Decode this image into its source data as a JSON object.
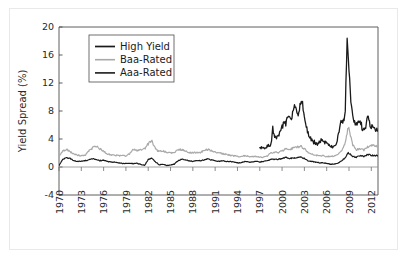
{
  "figure": {
    "background_color": "#ffffff",
    "frame_color": "#e9e9e9"
  },
  "chart_data": {
    "type": "line",
    "title": "",
    "xlabel": "",
    "ylabel": "Yield Spread (%)",
    "xlim": [
      1970,
      2012.9
    ],
    "ylim": [
      -4,
      20
    ],
    "grid": false,
    "legend_position": "upper-left",
    "x_tick_labels": [
      "1970",
      "1973",
      "1976",
      "1979",
      "1982",
      "1985",
      "1988",
      "1991",
      "1994",
      "1997",
      "2000",
      "2003",
      "2006",
      "2009",
      "2012"
    ],
    "x_ticks": [
      1970,
      1973,
      1976,
      1979,
      1982,
      1985,
      1988,
      1991,
      1994,
      1997,
      2000,
      2003,
      2006,
      2009,
      2012
    ],
    "y_tick_labels": [
      "20",
      "16",
      "12",
      "8",
      "4",
      "0",
      "-4"
    ],
    "y_ticks": [
      20,
      16,
      12,
      8,
      4,
      0,
      -4
    ],
    "zero_line": 0,
    "series": [
      {
        "name": "High Yield",
        "color": "#1a1a1a",
        "width": 1.3,
        "x_start": 1997.0,
        "x": [
          1997.0,
          1997.25,
          1997.5,
          1997.75,
          1998.0,
          1998.25,
          1998.5,
          1998.75,
          1999.0,
          1999.25,
          1999.5,
          1999.75,
          2000.0,
          2000.25,
          2000.5,
          2000.75,
          2001.0,
          2001.25,
          2001.5,
          2001.75,
          2002.0,
          2002.25,
          2002.5,
          2002.75,
          2003.0,
          2003.25,
          2003.5,
          2003.75,
          2004.0,
          2004.25,
          2004.5,
          2004.75,
          2005.0,
          2005.25,
          2005.5,
          2005.75,
          2006.0,
          2006.25,
          2006.5,
          2006.75,
          2007.0,
          2007.25,
          2007.5,
          2007.75,
          2008.0,
          2008.25,
          2008.5,
          2008.75,
          2009.0,
          2009.25,
          2009.5,
          2009.75,
          2010.0,
          2010.25,
          2010.5,
          2010.75,
          2011.0,
          2011.25,
          2011.5,
          2011.75,
          2012.0,
          2012.5,
          2012.9
        ],
        "values": [
          3.0,
          2.7,
          2.6,
          2.8,
          2.9,
          3.1,
          3.3,
          5.4,
          4.6,
          4.3,
          4.4,
          4.8,
          5.6,
          6.4,
          6.2,
          7.1,
          7.5,
          7.0,
          8.2,
          8.9,
          8.0,
          7.6,
          9.3,
          9.0,
          7.2,
          5.6,
          4.8,
          4.3,
          3.8,
          3.6,
          3.5,
          3.3,
          3.6,
          3.8,
          3.7,
          3.6,
          3.4,
          3.2,
          3.0,
          2.9,
          2.8,
          3.1,
          4.2,
          5.2,
          6.8,
          6.4,
          8.4,
          18.4,
          14.0,
          9.0,
          7.2,
          6.4,
          5.9,
          6.4,
          6.8,
          5.6,
          5.2,
          5.6,
          7.4,
          6.4,
          5.8,
          5.4,
          5.1
        ]
      },
      {
        "name": "Baa-Rated",
        "color": "#a9a9a9",
        "width": 1.2,
        "x_start": 1970.0,
        "x": [
          1970.0,
          1970.5,
          1971.0,
          1971.5,
          1972.0,
          1972.5,
          1973.0,
          1973.5,
          1974.0,
          1974.5,
          1975.0,
          1975.5,
          1976.0,
          1976.5,
          1977.0,
          1977.5,
          1978.0,
          1978.5,
          1979.0,
          1979.5,
          1980.0,
          1980.5,
          1981.0,
          1981.5,
          1982.0,
          1982.5,
          1983.0,
          1983.5,
          1984.0,
          1984.5,
          1985.0,
          1985.5,
          1986.0,
          1986.5,
          1987.0,
          1987.5,
          1988.0,
          1988.5,
          1989.0,
          1989.5,
          1990.0,
          1990.5,
          1991.0,
          1991.5,
          1992.0,
          1992.5,
          1993.0,
          1993.5,
          1994.0,
          1994.5,
          1995.0,
          1995.5,
          1996.0,
          1996.5,
          1997.0,
          1997.5,
          1998.0,
          1998.5,
          1999.0,
          1999.5,
          2000.0,
          2000.5,
          2001.0,
          2001.5,
          2002.0,
          2002.5,
          2003.0,
          2003.5,
          2004.0,
          2004.5,
          2005.0,
          2005.5,
          2006.0,
          2006.5,
          2007.0,
          2007.5,
          2008.0,
          2008.5,
          2008.9,
          2009.2,
          2009.5,
          2010.0,
          2010.5,
          2011.0,
          2011.5,
          2012.0,
          2012.5,
          2012.9
        ],
        "values": [
          1.5,
          2.3,
          2.5,
          2.2,
          1.9,
          1.7,
          1.6,
          1.7,
          2.3,
          2.7,
          3.0,
          2.6,
          2.2,
          1.9,
          1.7,
          1.7,
          1.6,
          1.6,
          1.6,
          1.9,
          2.6,
          2.4,
          2.4,
          2.6,
          3.3,
          3.7,
          2.5,
          2.2,
          2.3,
          2.1,
          2.0,
          2.1,
          2.4,
          2.5,
          2.3,
          2.1,
          2.0,
          2.1,
          2.1,
          2.3,
          2.5,
          2.3,
          2.1,
          2.0,
          1.9,
          1.8,
          1.7,
          1.6,
          1.5,
          1.5,
          1.6,
          1.5,
          1.5,
          1.5,
          1.4,
          1.4,
          1.6,
          2.0,
          2.1,
          2.1,
          2.3,
          2.6,
          2.5,
          2.7,
          2.8,
          3.0,
          2.6,
          2.1,
          1.9,
          1.7,
          1.6,
          1.6,
          1.5,
          1.5,
          1.6,
          1.8,
          2.4,
          3.4,
          5.7,
          4.4,
          3.2,
          2.5,
          2.6,
          2.4,
          2.9,
          3.1,
          3.0,
          2.9
        ]
      },
      {
        "name": "Aaa-Rated",
        "color": "#1a1a1a",
        "width": 1.2,
        "x_start": 1970.0,
        "x": [
          1970.0,
          1970.5,
          1971.0,
          1971.5,
          1972.0,
          1972.5,
          1973.0,
          1973.5,
          1974.0,
          1974.5,
          1975.0,
          1975.5,
          1976.0,
          1976.5,
          1977.0,
          1977.5,
          1978.0,
          1978.5,
          1979.0,
          1979.5,
          1980.0,
          1980.5,
          1981.0,
          1981.5,
          1982.0,
          1982.5,
          1983.0,
          1983.5,
          1984.0,
          1984.5,
          1985.0,
          1985.5,
          1986.0,
          1986.5,
          1987.0,
          1987.5,
          1988.0,
          1988.5,
          1989.0,
          1989.5,
          1990.0,
          1990.5,
          1991.0,
          1991.5,
          1992.0,
          1992.5,
          1993.0,
          1993.5,
          1994.0,
          1994.5,
          1995.0,
          1995.5,
          1996.0,
          1996.5,
          1997.0,
          1997.5,
          1998.0,
          1998.5,
          1999.0,
          1999.5,
          2000.0,
          2000.5,
          2001.0,
          2001.5,
          2002.0,
          2002.5,
          2003.0,
          2003.5,
          2004.0,
          2004.5,
          2005.0,
          2005.5,
          2006.0,
          2006.5,
          2007.0,
          2007.5,
          2008.0,
          2008.5,
          2008.9,
          2009.2,
          2009.5,
          2010.0,
          2010.5,
          2011.0,
          2011.5,
          2012.0,
          2012.5,
          2012.9
        ],
        "values": [
          0.2,
          1.1,
          1.3,
          1.2,
          0.9,
          0.8,
          0.8,
          0.9,
          1.0,
          1.2,
          1.1,
          0.9,
          1.0,
          0.8,
          0.7,
          0.7,
          0.6,
          0.5,
          0.5,
          0.5,
          0.5,
          0.5,
          0.4,
          0.2,
          1.1,
          1.3,
          0.7,
          0.3,
          0.4,
          0.2,
          0.3,
          0.4,
          0.9,
          1.1,
          1.0,
          0.9,
          0.8,
          0.9,
          0.9,
          1.0,
          1.2,
          1.0,
          0.9,
          0.8,
          0.9,
          0.8,
          0.8,
          0.7,
          0.6,
          0.6,
          0.8,
          0.7,
          0.7,
          0.8,
          0.7,
          0.8,
          0.9,
          1.1,
          1.1,
          1.1,
          1.2,
          1.4,
          1.2,
          1.3,
          1.3,
          1.4,
          1.2,
          0.9,
          0.8,
          0.7,
          0.6,
          0.6,
          0.5,
          0.4,
          0.4,
          0.5,
          0.9,
          1.3,
          2.0,
          1.8,
          1.5,
          1.4,
          1.6,
          1.5,
          1.8,
          1.7,
          1.6,
          1.6
        ]
      }
    ]
  }
}
